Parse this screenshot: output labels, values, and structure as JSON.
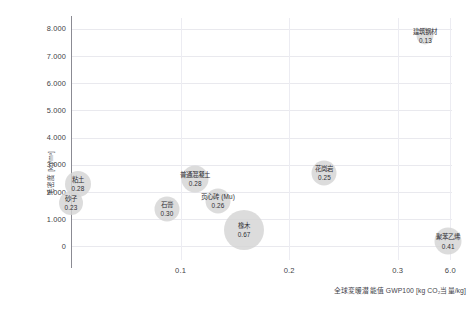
{
  "chart_data": {
    "type": "scatter",
    "title": "",
    "xlabel": "全球変暖潜能值 GWP100 [kg CO₂当量/kg]",
    "ylabel": "毛密度 [kg/m³]",
    "xlim": [
      0,
      0.35
    ],
    "ylim": [
      -500,
      8400
    ],
    "grid": true,
    "legend": "none",
    "x_ticks": [
      "0.1",
      "0.2",
      "0.3",
      "6.0"
    ],
    "y_ticks": [
      "8.000",
      "7.000",
      "6.000",
      "5.000",
      "4.000",
      "3.000",
      "2.000",
      "1.000",
      "0"
    ],
    "bubble_color": "#d4d4d4",
    "points": [
      {
        "name": "粘土",
        "value": "0.28",
        "x": 0.0055,
        "y": 2300,
        "size": 26
      },
      {
        "name": "砂子",
        "value": "0.23",
        "x": -0.001,
        "y": 1600,
        "size": 24
      },
      {
        "name": "普通混凝土",
        "value": "0.28",
        "x": 0.1135,
        "y": 2480,
        "size": 27
      },
      {
        "name": "石膏",
        "value": "0.30",
        "x": 0.0875,
        "y": 1380,
        "size": 25
      },
      {
        "name": "页心砖 (Mu)",
        "value": "0.26",
        "x": 0.1345,
        "y": 1680,
        "size": 25
      },
      {
        "name": "橡木",
        "value": "0.67",
        "x": 0.1585,
        "y": 600,
        "size": 40
      },
      {
        "name": "花岗岩",
        "value": "0.25",
        "x": 0.2325,
        "y": 2700,
        "size": 25
      },
      {
        "name": "建筑钢材",
        "value": "0.13",
        "x": 0.3255,
        "y": 7740,
        "size": 17
      },
      {
        "name": "聚苯乙烯",
        "value": "0.41",
        "x": 0.3465,
        "y": 190,
        "size": 27
      }
    ]
  }
}
